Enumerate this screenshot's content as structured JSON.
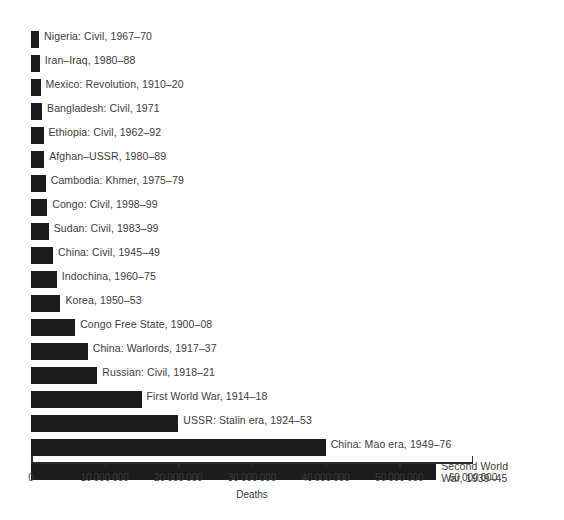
{
  "chart_data": {
    "type": "bar",
    "orientation": "horizontal",
    "title": "",
    "xlabel": "Deaths",
    "ylabel": "",
    "xlim": [
      0,
      60000000
    ],
    "grid": false,
    "legend": null,
    "xticks": [
      0,
      10000000,
      20000000,
      30000000,
      40000000,
      50000000,
      60000000
    ],
    "xtick_labels": [
      "0",
      "10 000 000",
      "20 000 000",
      "30 000 000",
      "40 000 000",
      "50 000 000",
      "60 000 000"
    ],
    "bar_color": "#1c1c1c",
    "label_color": "#3b3b3b",
    "categories": [
      "Nigeria: Civil, 1967–70",
      "Iran–Iraq, 1980–88",
      "Mexico: Revolution, 1910–20",
      "Bangladesh: Civil, 1971",
      "Ethiopia: Civil, 1962–92",
      "Afghan–USSR, 1980–89",
      "Cambodia: Khmer, 1975–79",
      "Congo: Civil, 1998–99",
      "Sudan: Civil, 1983–99",
      "China: Civil, 1945–49",
      "Indochina, 1960–75",
      "Korea, 1950–53",
      "Congo Free State, 1900–08",
      "China: Warlords, 1917–37",
      "Russian: Civil, 1918–21",
      "First World War, 1914–18",
      "USSR: Stalin era, 1924–53",
      "China: Mao era, 1949–76",
      "Second World War, 1939–45"
    ],
    "values": [
      1100000,
      1200000,
      1300000,
      1500000,
      1700000,
      1800000,
      2000000,
      2200000,
      2400000,
      3000000,
      3500000,
      4000000,
      6000000,
      7700000,
      9000000,
      15000000,
      20000000,
      40000000,
      55000000
    ]
  },
  "bars": [
    {
      "label": "Nigeria: Civil, 1967–70",
      "value": 1100000,
      "wrap": false
    },
    {
      "label": "Iran–Iraq, 1980–88",
      "value": 1200000,
      "wrap": false
    },
    {
      "label": "Mexico: Revolution, 1910–20",
      "value": 1300000,
      "wrap": false
    },
    {
      "label": "Bangladesh: Civil, 1971",
      "value": 1500000,
      "wrap": false
    },
    {
      "label": "Ethiopia: Civil, 1962–92",
      "value": 1700000,
      "wrap": false
    },
    {
      "label": "Afghan–USSR, 1980–89",
      "value": 1800000,
      "wrap": false
    },
    {
      "label": "Cambodia: Khmer, 1975–79",
      "value": 2000000,
      "wrap": false
    },
    {
      "label": "Congo: Civil, 1998–99",
      "value": 2200000,
      "wrap": false
    },
    {
      "label": "Sudan: Civil, 1983–99",
      "value": 2400000,
      "wrap": false
    },
    {
      "label": "China: Civil, 1945–49",
      "value": 3000000,
      "wrap": false
    },
    {
      "label": "Indochina, 1960–75",
      "value": 3500000,
      "wrap": false
    },
    {
      "label": "Korea, 1950–53",
      "value": 4000000,
      "wrap": false
    },
    {
      "label": "Congo Free State, 1900–08",
      "value": 6000000,
      "wrap": false
    },
    {
      "label": "China: Warlords, 1917–37",
      "value": 7700000,
      "wrap": false
    },
    {
      "label": "Russian: Civil, 1918–21",
      "value": 9000000,
      "wrap": false
    },
    {
      "label": "First World War, 1914–18",
      "value": 15000000,
      "wrap": false
    },
    {
      "label": "USSR: Stalin era, 1924–53",
      "value": 20000000,
      "wrap": false
    },
    {
      "label": "China: Mao era, 1949–76",
      "value": 40000000,
      "wrap": false
    },
    {
      "label": "Second World War, 1939–45",
      "value": 55000000,
      "wrap": true
    }
  ],
  "axis": {
    "title": "Deaths",
    "ticks": [
      {
        "value": 0,
        "label": "0"
      },
      {
        "value": 10000000,
        "label": "10 000 000"
      },
      {
        "value": 20000000,
        "label": "20 000 000"
      },
      {
        "value": 30000000,
        "label": "30 000 000"
      },
      {
        "value": 40000000,
        "label": "40 000 000"
      },
      {
        "value": 50000000,
        "label": "50 000 000"
      },
      {
        "value": 60000000,
        "label": "60 000 000"
      }
    ]
  }
}
